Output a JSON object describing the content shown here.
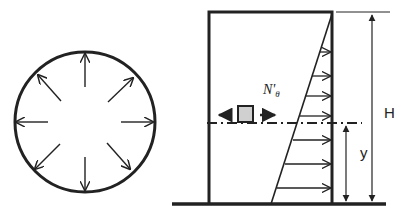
{
  "diagram": {
    "title": "",
    "left_figure": {
      "description": "Circular tank cross-section with radial outward pressure arrows",
      "arrow_count": 8
    },
    "right_figure": {
      "description": "Tank wall elevation with triangular hydrostatic pressure distribution",
      "element_label": "N'",
      "element_label_sub": "θ",
      "height_label": "H",
      "depth_label": "y",
      "pressure_arrow_count": 7
    },
    "colors": {
      "stroke": "#222222",
      "element_fill": "#d0d0d0",
      "background": "#ffffff"
    }
  }
}
